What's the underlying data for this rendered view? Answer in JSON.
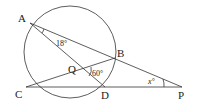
{
  "diagram": {
    "type": "circle-geometry",
    "circle": {
      "cx": 70,
      "cy": 52,
      "r": 46
    },
    "points": {
      "A": {
        "label": "A",
        "x": 30,
        "y": 23
      },
      "B": {
        "label": "B",
        "x": 115,
        "y": 58
      },
      "C": {
        "label": "C",
        "x": 26,
        "y": 87
      },
      "D": {
        "label": "D",
        "x": 105,
        "y": 87
      },
      "P": {
        "label": "P",
        "x": 182,
        "y": 87
      },
      "Q": {
        "label": "Q",
        "x": 82,
        "y": 70
      }
    },
    "segments": [
      "A-P",
      "A-D",
      "C-B",
      "C-P"
    ],
    "angles": {
      "angle_BAD": {
        "label": "18°",
        "vertex": "A"
      },
      "angle_BQD": {
        "label": "60°",
        "vertex": "Q"
      },
      "angle_APC": {
        "label": "x°",
        "vertex": "P"
      }
    }
  }
}
